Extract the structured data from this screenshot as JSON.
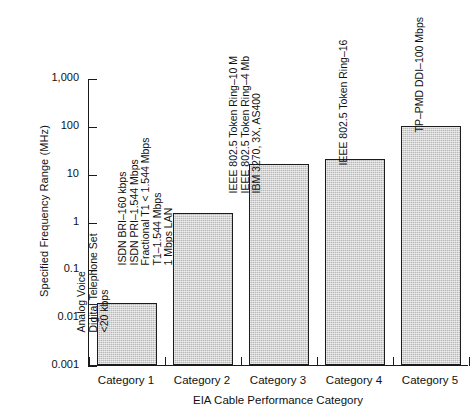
{
  "chart_data": {
    "type": "bar",
    "title": "",
    "xlabel": "EIA Cable Performance Category",
    "ylabel": "Specified Frequency Range (MHz)",
    "yscale": "log",
    "ylim": [
      0.001,
      1000
    ],
    "ytick_labels": [
      "1,000",
      "100",
      "10",
      "1",
      "0.1",
      "0.01",
      "0.001"
    ],
    "ytick_values": [
      1000,
      100,
      10,
      1,
      0.1,
      0.01,
      0.001
    ],
    "grid": false,
    "legend": "none",
    "categories": [
      "Category 1",
      "Category 2",
      "Category 3",
      "Category 4",
      "Category 5"
    ],
    "values": [
      0.02,
      1.5,
      16,
      20,
      100
    ],
    "value_units": "MHz",
    "annotations": [
      [
        "Analog Voice",
        "Digital Telephone Set",
        "<20 kbps"
      ],
      [
        "ISDN BRI–160 kbps",
        "ISDN PRI–1.544 Mbps",
        "Fractional T1 < 1.544 Mbps",
        "T1–1.544 Mbps",
        "1 Mbps LAN"
      ],
      [
        "IEEE 802.5 Token Ring–10 M",
        "IEEE 802.5 Token Ring–4 Mb",
        "IBM 3270, 3X, AS400"
      ],
      [
        "IEEE 802.5 Token Ring–16"
      ],
      [
        "TP–PMD DDI–100 Mbps"
      ]
    ],
    "bar_fill_color": "#b9b9b9",
    "bar_edge_color": "#1c1c1c",
    "axis_color": "#1a1a1a",
    "background_color": "#ffffff"
  }
}
